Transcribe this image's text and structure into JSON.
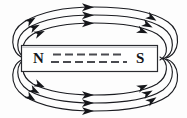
{
  "figure": {
    "type": "physics-diagram",
    "width": 187,
    "height": 118,
    "background_color": "#fdfdfd",
    "line_color": "#1a1b20",
    "magnet": {
      "name": "bar-magnet",
      "fill_color": "#ffffff",
      "border_color": "#2a2b30",
      "x": 21,
      "y": 45,
      "width": 137,
      "height": 27,
      "north_label": "N",
      "south_label": "S",
      "internal_dash_rows": 2,
      "internal_dash_count_per_row": 8,
      "internal_dash_color": "#4a4b50"
    },
    "field_lines": {
      "description": "Closed magnetic field loops running from N pole around to S pole",
      "loops_above": 3,
      "loops_below": 3,
      "direction": "clockwise-rightward",
      "arrowhead_color": "#15161a",
      "arrowheads_top": 3,
      "arrowheads_bottom": 3,
      "arrowheads_left": 6,
      "arrowheads_right": 6
    }
  }
}
